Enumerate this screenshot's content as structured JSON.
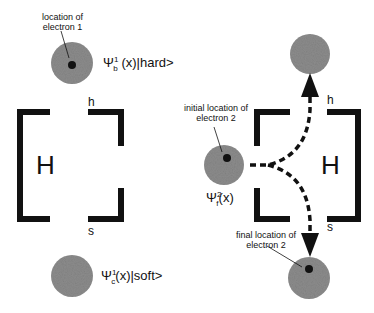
{
  "left_panel": {
    "electron1_note_line1": "location of",
    "electron1_note_line2": "electron 1",
    "state_b": {
      "psi": "Ψ",
      "sup": "1",
      "sub": "b",
      "rest": "(x)|hard>"
    },
    "state_c": {
      "psi": "Ψ",
      "sup": "1",
      "sub": "c",
      "rest": "(x)|soft>"
    },
    "box_label": "H",
    "h_label": "h",
    "s_label": "s"
  },
  "right_panel": {
    "initial_note_line1": "initial location of",
    "initial_note_line2": "electron 2",
    "state_f": {
      "psi": "Ψ",
      "sup": "2",
      "sub": "f",
      "rest": "(x)"
    },
    "final_note_line1": "final location of",
    "final_note_line2": "electron 2",
    "box_label": "H",
    "h_label": "h",
    "s_label": "s"
  },
  "colors": {
    "blob": "#8a8a8a",
    "ink": "#111111"
  }
}
